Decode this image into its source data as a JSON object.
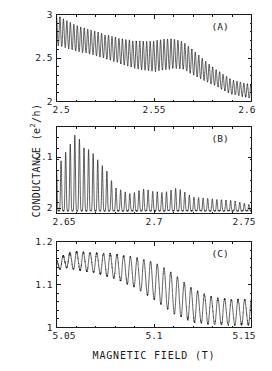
{
  "figure": {
    "axis_labels": {
      "y_prefix": "CONDUCTANCE  (e",
      "y_exponent": "2",
      "y_suffix": "/h)",
      "y_full": "CONDUCTANCE (e2/h)",
      "x": "MAGNETIC FIELD  (T)"
    },
    "panels": [
      {
        "tag": "(A)",
        "xlim": [
          2.5,
          2.6
        ],
        "ylim": [
          2.0,
          3.0
        ],
        "xticks": [
          2.5,
          2.55,
          2.6
        ],
        "xticklabels": [
          "2.5",
          "2.55",
          "2.6"
        ],
        "yticks": [
          2.0,
          2.5,
          3.0
        ],
        "yticklabels": [
          "2",
          "2.5",
          "3"
        ]
      },
      {
        "tag": "(B)",
        "xlim": [
          2.65,
          2.75
        ],
        "ylim": [
          1.99,
          2.16
        ],
        "xticks": [
          2.65,
          2.7,
          2.75
        ],
        "xticklabels": [
          "2.65",
          "2.7",
          "2.75"
        ],
        "yticks": [
          2.0,
          2.1
        ],
        "yticklabels": [
          "2",
          "2.1"
        ]
      },
      {
        "tag": "(C)",
        "xlim": [
          5.05,
          5.15
        ],
        "ylim": [
          1.0,
          1.2
        ],
        "xticks": [
          5.05,
          5.1,
          5.15
        ],
        "xticklabels": [
          "5.05",
          "5.1",
          "5.15"
        ],
        "yticks": [
          1.0,
          1.1,
          1.2
        ],
        "yticklabels": [
          "1",
          "1.1",
          "1.2"
        ]
      }
    ]
  },
  "chart_data": [
    {
      "type": "line",
      "panel": "(A)",
      "title": "",
      "xlabel": "MAGNETIC FIELD (T)",
      "ylabel": "CONDUCTANCE (e2/h)",
      "xlim": [
        2.5,
        2.6
      ],
      "ylim": [
        2.0,
        3.0
      ],
      "grid": false,
      "legend": false,
      "annotations": [
        "(A)"
      ],
      "description": "Rapid Aharonov-Bohm-like conductance oscillations on a decreasing background; oscillation amplitude beats, with a local amplitude revival near 2.555-2.565 T.",
      "oscillation_period": 0.00178,
      "background": {
        "x": [
          2.5,
          2.51,
          2.52,
          2.53,
          2.54,
          2.55,
          2.555,
          2.56,
          2.565,
          2.57,
          2.58,
          2.59,
          2.6
        ],
        "y": [
          2.81,
          2.72,
          2.66,
          2.59,
          2.53,
          2.51,
          2.53,
          2.54,
          2.52,
          2.44,
          2.29,
          2.16,
          2.11
        ]
      },
      "envelope": {
        "x": [
          2.5,
          2.505,
          2.515,
          2.525,
          2.535,
          2.545,
          2.552,
          2.558,
          2.565,
          2.572,
          2.58,
          2.59,
          2.6
        ],
        "half_amplitude": [
          0.185,
          0.165,
          0.15,
          0.145,
          0.155,
          0.175,
          0.19,
          0.185,
          0.165,
          0.14,
          0.105,
          0.085,
          0.08
        ]
      }
    },
    {
      "type": "line",
      "panel": "(B)",
      "title": "",
      "xlabel": "MAGNETIC FIELD (T)",
      "ylabel": "CONDUCTANCE (e2/h)",
      "xlim": [
        2.65,
        2.75
      ],
      "ylim": [
        1.99,
        2.16
      ],
      "grid": false,
      "legend": false,
      "annotations": [
        "(B)"
      ],
      "description": "Sharp resonance spikes rising from a flat baseline near 2.0; peak heights decay strongly with increasing field, nearly vanishing past 2.73 T.",
      "oscillation_period": 0.00235,
      "baseline": 1.995,
      "peak_envelope": {
        "x": [
          2.65,
          2.654,
          2.657,
          2.66,
          2.664,
          2.668,
          2.672,
          2.676,
          2.68,
          2.688,
          2.695,
          2.7,
          2.705,
          2.712,
          2.72,
          2.73,
          2.74,
          2.75
        ],
        "peak_value": [
          2.075,
          2.105,
          2.125,
          2.148,
          2.118,
          2.112,
          2.09,
          2.072,
          2.04,
          2.028,
          2.038,
          2.033,
          2.03,
          2.04,
          2.022,
          2.018,
          2.015,
          2.006
        ]
      }
    },
    {
      "type": "line",
      "panel": "(C)",
      "title": "",
      "xlabel": "MAGNETIC FIELD (T)",
      "ylabel": "CONDUCTANCE (e2/h)",
      "xlim": [
        5.05,
        5.15
      ],
      "ylim": [
        1.0,
        1.2
      ],
      "grid": false,
      "legend": false,
      "annotations": [
        "(C)"
      ],
      "description": "Regular oscillations on a background falling from ~1.16 to ~1.03; oscillation amplitude grows toward mid-field then settles, lower frequency than panels A and B.",
      "oscillation_period": 0.00345,
      "background": {
        "x": [
          5.05,
          5.055,
          5.06,
          5.07,
          5.08,
          5.09,
          5.1,
          5.11,
          5.12,
          5.13,
          5.14,
          5.15
        ],
        "y": [
          1.145,
          1.155,
          1.155,
          1.15,
          1.142,
          1.128,
          1.108,
          1.078,
          1.05,
          1.038,
          1.035,
          1.035
        ]
      },
      "envelope": {
        "x": [
          5.05,
          5.06,
          5.07,
          5.08,
          5.09,
          5.1,
          5.11,
          5.12,
          5.13,
          5.14,
          5.15
        ],
        "half_amplitude": [
          0.012,
          0.022,
          0.024,
          0.03,
          0.036,
          0.045,
          0.048,
          0.04,
          0.033,
          0.031,
          0.031
        ]
      }
    }
  ]
}
